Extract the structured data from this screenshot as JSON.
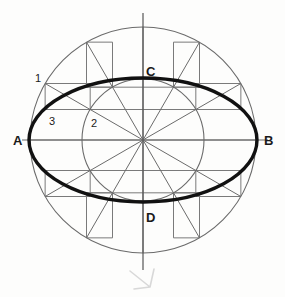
{
  "figure": {
    "canvas": {
      "width": 285,
      "height": 297,
      "background": "#fdfdfc"
    },
    "center": {
      "x": 143,
      "y": 140
    },
    "outer_circle": {
      "radius": 113,
      "stroke": "#6b6b6b",
      "stroke_width": 1.1
    },
    "inner_circle": {
      "radius": 61,
      "stroke": "#6b6b6b",
      "stroke_width": 1.1
    },
    "ellipse": {
      "semi_major_a": 114,
      "semi_minor_b": 62,
      "stroke": "#111111",
      "stroke_width": 3.4
    },
    "axes": {
      "vertical": {
        "x": 143,
        "y1": 13,
        "y2": 270,
        "stroke": "#555555"
      },
      "horizontal": {
        "y": 140,
        "x1": 22,
        "x2": 268,
        "stroke": "#6b6b6b"
      }
    },
    "spokes": {
      "count": 12,
      "angle_step_degrees": 30,
      "stroke": "#6b6b6b",
      "stroke_width": 1.0
    },
    "construction": {
      "method": "concentric circles / trammel",
      "stroke": "#7a7a7a",
      "stroke_width": 1.0,
      "note": "horizontal projectors from inner circle, vertical projectors from outer circle"
    },
    "pencil_mark": {
      "glyph": "check-squiggle",
      "stroke": "#d8d8d8",
      "x": 148,
      "y": 281
    }
  },
  "labels": {
    "vertex_a": {
      "text": "A",
      "x": 13,
      "y": 145,
      "kind": "major"
    },
    "vertex_b": {
      "text": "B",
      "x": 264,
      "y": 145,
      "kind": "major"
    },
    "vertex_c": {
      "text": "C",
      "x": 146,
      "y": 76,
      "kind": "major"
    },
    "vertex_d": {
      "text": "D",
      "x": 146,
      "y": 222,
      "kind": "major"
    },
    "point_1": {
      "text": "1",
      "x": 35,
      "y": 82,
      "kind": "minor"
    },
    "point_2": {
      "text": "2",
      "x": 91,
      "y": 127,
      "kind": "minor"
    },
    "point_3": {
      "text": "3",
      "x": 49,
      "y": 125,
      "kind": "minor"
    }
  },
  "colors": {
    "ink_dark": "#111111",
    "ink_mid": "#6b6b6b",
    "ink_light": "#7a7a7a",
    "pencil_faint": "#d8d8d8",
    "paper": "#fdfdfc"
  }
}
